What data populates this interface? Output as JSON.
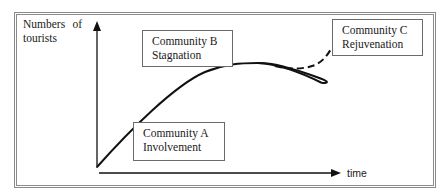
{
  "diagram": {
    "type": "tourism-area-life-cycle",
    "y_axis": {
      "label_line1": "Numbers of",
      "label_line2": "tourists"
    },
    "x_axis": {
      "label": "time"
    },
    "stages": [
      {
        "id": "A",
        "line1": "Community A",
        "line2": "Involvement"
      },
      {
        "id": "B",
        "line1": "Community B",
        "line2": "Stagnation"
      },
      {
        "id": "C",
        "line1": "Community C",
        "line2": "Rejuvenation"
      }
    ],
    "curves": {
      "main": "solid growth curve rising from origin, peaking and then declining",
      "rejuvenation": "dashed branch rising after the peak"
    },
    "colors": {
      "line": "#111111",
      "frame": "#8a8a8a",
      "box_border": "#6a6a6a",
      "background": "#ffffff"
    }
  }
}
